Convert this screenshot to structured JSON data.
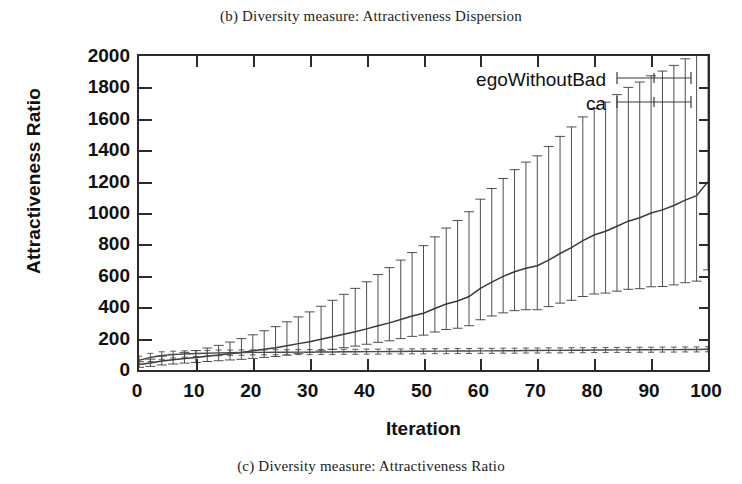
{
  "caption_top": "(b) Diversity measure: Attractiveness Dispersion",
  "caption_bottom": "(c) Diversity measure: Attractiveness Ratio",
  "colors": {
    "axis": "#2b2b2b",
    "series_ego": "#3a3a3a",
    "series_ca": "#4a4a4a",
    "background": "#ffffff"
  },
  "chart_data": {
    "type": "line",
    "title": "",
    "xlabel": "Iteration",
    "ylabel": "Attractiveness Ratio",
    "xlim": [
      0,
      100
    ],
    "ylim": [
      0,
      2000
    ],
    "xticks": [
      0,
      10,
      20,
      30,
      40,
      50,
      60,
      70,
      80,
      90,
      100
    ],
    "yticks": [
      0,
      200,
      400,
      600,
      800,
      1000,
      1200,
      1400,
      1600,
      1800,
      2000
    ],
    "grid": false,
    "legend_position": "top-right",
    "errorbars": true,
    "x": [
      0,
      2,
      4,
      6,
      8,
      10,
      12,
      14,
      16,
      18,
      20,
      22,
      24,
      26,
      28,
      30,
      32,
      34,
      36,
      38,
      40,
      42,
      44,
      46,
      48,
      50,
      52,
      54,
      56,
      58,
      60,
      62,
      64,
      66,
      68,
      70,
      72,
      74,
      76,
      78,
      80,
      82,
      84,
      86,
      88,
      90,
      92,
      94,
      96,
      98,
      100
    ],
    "series": [
      {
        "name": "egoWithoutBad",
        "values": [
          35,
          45,
          58,
          66,
          74,
          80,
          88,
          95,
          104,
          112,
          122,
          132,
          142,
          155,
          168,
          180,
          196,
          212,
          228,
          244,
          262,
          282,
          300,
          322,
          344,
          362,
          392,
          420,
          440,
          468,
          520,
          560,
          596,
          626,
          648,
          664,
          700,
          742,
          780,
          824,
          860,
          884,
          916,
          948,
          970,
          1000,
          1020,
          1048,
          1082,
          1110,
          1200
        ],
        "err_low": [
          18,
          22,
          26,
          28,
          30,
          32,
          34,
          36,
          40,
          44,
          48,
          52,
          56,
          60,
          64,
          68,
          74,
          80,
          86,
          92,
          98,
          106,
          114,
          122,
          130,
          140,
          150,
          162,
          174,
          186,
          200,
          216,
          232,
          248,
          264,
          280,
          296,
          316,
          336,
          356,
          376,
          394,
          414,
          434,
          452,
          470,
          488,
          506,
          526,
          544,
          562
        ],
        "err_high": [
          18,
          24,
          30,
          34,
          38,
          44,
          52,
          62,
          74,
          88,
          102,
          118,
          134,
          152,
          170,
          190,
          210,
          232,
          254,
          276,
          300,
          326,
          352,
          378,
          404,
          430,
          456,
          484,
          512,
          540,
          568,
          596,
          624,
          650,
          676,
          700,
          724,
          746,
          768,
          788,
          806,
          822,
          838,
          852,
          864,
          874,
          884,
          892,
          900,
          906,
          912
        ]
      },
      {
        "name": "ca",
        "values": [
          62,
          80,
          92,
          98,
          102,
          105,
          107,
          109,
          110,
          111,
          112,
          112,
          113,
          113,
          114,
          114,
          115,
          115,
          116,
          116,
          117,
          117,
          118,
          118,
          119,
          119,
          120,
          120,
          121,
          121,
          122,
          122,
          123,
          123,
          124,
          124,
          125,
          125,
          126,
          126,
          127,
          127,
          128,
          128,
          129,
          129,
          130,
          130,
          131,
          131,
          132
        ],
        "err_low": [
          26,
          26,
          24,
          22,
          20,
          19,
          18,
          18,
          17,
          17,
          16,
          16,
          16,
          16,
          16,
          16,
          16,
          16,
          16,
          16,
          16,
          16,
          16,
          16,
          16,
          16,
          16,
          16,
          16,
          16,
          16,
          16,
          16,
          16,
          16,
          16,
          16,
          16,
          16,
          16,
          16,
          16,
          16,
          16,
          16,
          16,
          16,
          16,
          16,
          16,
          16
        ],
        "err_high": [
          26,
          26,
          24,
          22,
          20,
          19,
          18,
          18,
          17,
          17,
          16,
          16,
          16,
          16,
          16,
          16,
          16,
          16,
          16,
          16,
          16,
          16,
          16,
          16,
          16,
          16,
          16,
          16,
          16,
          16,
          16,
          16,
          16,
          16,
          16,
          16,
          16,
          16,
          16,
          16,
          16,
          16,
          16,
          16,
          16,
          16,
          16,
          16,
          16,
          16,
          16
        ]
      }
    ],
    "legend": [
      {
        "label": "egoWithoutBad",
        "symbol": "errorbar-horizontal"
      },
      {
        "label": "ca",
        "symbol": "errorbar-horizontal"
      }
    ]
  }
}
